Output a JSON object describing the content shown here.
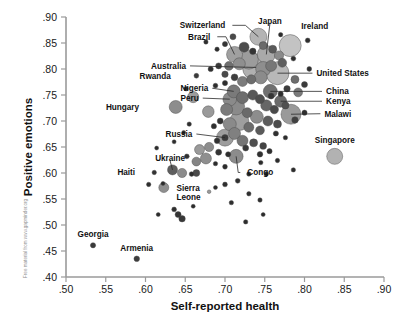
{
  "figure": {
    "credit_text": "Free material from www.gapminder.org",
    "background_color": "#ffffff"
  },
  "chart_data": {
    "type": "scatter",
    "title": "",
    "subtitle": "",
    "xlabel": "Self-reported health",
    "ylabel": "Positive emotions",
    "xlim": [
      0.5,
      0.9
    ],
    "ylim": [
      0.4,
      0.9
    ],
    "xticks": [
      ".50",
      ".55",
      ".60",
      ".65",
      ".70",
      ".75",
      ".80",
      ".85",
      ".90"
    ],
    "xtick_values": [
      0.5,
      0.55,
      0.6,
      0.65,
      0.7,
      0.75,
      0.8,
      0.85,
      0.9
    ],
    "yticks": [
      ".40",
      ".45",
      ".50",
      ".55",
      ".60",
      ".65",
      ".70",
      ".75",
      ".80",
      ".85",
      ".90"
    ],
    "ytick_values": [
      0.4,
      0.45,
      0.5,
      0.55,
      0.6,
      0.65,
      0.7,
      0.75,
      0.8,
      0.85,
      0.9
    ],
    "grid": false,
    "legend_position": "none",
    "marker_encoding": "bubble size encodes population; gray fill shades vary by region",
    "annotations": [
      {
        "label": "Switzerland",
        "x": 0.742,
        "y": 0.862,
        "lx": 0.7055,
        "ly": 0.884,
        "leader": true
      },
      {
        "label": "Japan",
        "x": 0.752,
        "y": 0.828,
        "lx": 0.7565,
        "ly": 0.893,
        "leader": true
      },
      {
        "label": "Ireland",
        "x": 0.782,
        "y": 0.845,
        "lx": 0.791,
        "ly": 0.883,
        "leader": false
      },
      {
        "label": "Brazil",
        "x": 0.712,
        "y": 0.828,
        "lx": 0.6865,
        "ly": 0.862,
        "leader": true
      },
      {
        "label": "Australia",
        "x": 0.739,
        "y": 0.803,
        "lx": 0.656,
        "ly": 0.806,
        "leader": true
      },
      {
        "label": "United States",
        "x": 0.766,
        "y": 0.792,
        "lx": 0.81,
        "ly": 0.792,
        "leader": true
      },
      {
        "label": "China",
        "x": 0.757,
        "y": 0.757,
        "lx": 0.822,
        "ly": 0.757,
        "leader": true
      },
      {
        "label": "Kenya",
        "x": 0.77,
        "y": 0.738,
        "lx": 0.822,
        "ly": 0.738,
        "leader": true
      },
      {
        "label": "Malawi",
        "x": 0.783,
        "y": 0.713,
        "lx": 0.82,
        "ly": 0.714,
        "leader": true
      },
      {
        "label": "Singapore",
        "x": 0.838,
        "y": 0.632,
        "lx": 0.838,
        "ly": 0.664,
        "leader": false
      },
      {
        "label": "Rwanda",
        "x": 0.664,
        "y": 0.787,
        "lx": 0.637,
        "ly": 0.787,
        "leader": false
      },
      {
        "label": "Nigeria",
        "x": 0.711,
        "y": 0.757,
        "lx": 0.684,
        "ly": 0.763,
        "leader": true
      },
      {
        "label": "Peru",
        "x": 0.706,
        "y": 0.742,
        "lx": 0.672,
        "ly": 0.744,
        "leader": true
      },
      {
        "label": "Hungary",
        "x": 0.638,
        "y": 0.727,
        "lx": 0.597,
        "ly": 0.727,
        "leader": false
      },
      {
        "label": "Russia",
        "x": 0.7,
        "y": 0.668,
        "lx": 0.664,
        "ly": 0.675,
        "leader": true
      },
      {
        "label": "Ukraine",
        "x": 0.634,
        "y": 0.606,
        "lx": 0.631,
        "ly": 0.629,
        "leader": true
      },
      {
        "label": "Haiti",
        "x": 0.611,
        "y": 0.601,
        "lx": 0.592,
        "ly": 0.602,
        "leader": false
      },
      {
        "label": "Sierra Leone",
        "x": 0.623,
        "y": 0.572,
        "lx": 0.634,
        "ly": 0.572,
        "leader": false
      },
      {
        "label": "Congo",
        "x": 0.714,
        "y": 0.632,
        "lx": 0.723,
        "ly": 0.601,
        "leader": true
      },
      {
        "label": "Georgia",
        "x": 0.534,
        "y": 0.461,
        "lx": 0.534,
        "ly": 0.482,
        "leader": false
      },
      {
        "label": "Armenia",
        "x": 0.589,
        "y": 0.435,
        "lx": 0.589,
        "ly": 0.456,
        "leader": false
      }
    ],
    "points": [
      {
        "x": 0.742,
        "y": 0.862,
        "r": 8.5,
        "c": "#b4b4b4"
      },
      {
        "x": 0.752,
        "y": 0.828,
        "r": 9.0,
        "c": "#a9a9a9"
      },
      {
        "x": 0.782,
        "y": 0.845,
        "r": 11.0,
        "c": "#c3c3c3"
      },
      {
        "x": 0.712,
        "y": 0.828,
        "r": 8.0,
        "c": "#a0a0a0"
      },
      {
        "x": 0.739,
        "y": 0.803,
        "r": 13.5,
        "c": "#b0b0b0"
      },
      {
        "x": 0.766,
        "y": 0.792,
        "r": 11.5,
        "c": "#b8b8b8"
      },
      {
        "x": 0.757,
        "y": 0.757,
        "r": 7.0,
        "c": "#707070"
      },
      {
        "x": 0.77,
        "y": 0.738,
        "r": 6.0,
        "c": "#6b6b6b"
      },
      {
        "x": 0.783,
        "y": 0.713,
        "r": 10.0,
        "c": "#9a9a9a"
      },
      {
        "x": 0.838,
        "y": 0.632,
        "r": 8.0,
        "c": "#b2b2b2"
      },
      {
        "x": 0.664,
        "y": 0.787,
        "r": 2.4,
        "c": "#3a3a3a"
      },
      {
        "x": 0.711,
        "y": 0.757,
        "r": 6.5,
        "c": "#7a7a7a"
      },
      {
        "x": 0.706,
        "y": 0.742,
        "r": 6.8,
        "c": "#8a8a8a"
      },
      {
        "x": 0.638,
        "y": 0.727,
        "r": 6.5,
        "c": "#8d8d8d"
      },
      {
        "x": 0.7,
        "y": 0.668,
        "r": 8.5,
        "c": "#9d9d9d"
      },
      {
        "x": 0.634,
        "y": 0.606,
        "r": 5.0,
        "c": "#5e5e5e"
      },
      {
        "x": 0.611,
        "y": 0.601,
        "r": 2.2,
        "c": "#333333"
      },
      {
        "x": 0.623,
        "y": 0.572,
        "r": 5.0,
        "c": "#8f8f8f"
      },
      {
        "x": 0.714,
        "y": 0.632,
        "r": 7.0,
        "c": "#8c8c8c"
      },
      {
        "x": 0.534,
        "y": 0.461,
        "r": 2.6,
        "c": "#3a3a3a"
      },
      {
        "x": 0.589,
        "y": 0.435,
        "r": 2.8,
        "c": "#3d3d3d"
      },
      {
        "x": 0.676,
        "y": 0.852,
        "r": 2.2,
        "c": "#2e2e2e"
      },
      {
        "x": 0.804,
        "y": 0.855,
        "r": 2.4,
        "c": "#2e2e2e"
      },
      {
        "x": 0.724,
        "y": 0.842,
        "r": 5.0,
        "c": "#4d4d4d"
      },
      {
        "x": 0.735,
        "y": 0.834,
        "r": 3.2,
        "c": "#343434"
      },
      {
        "x": 0.748,
        "y": 0.845,
        "r": 4.0,
        "c": "#6a6a6a"
      },
      {
        "x": 0.76,
        "y": 0.838,
        "r": 4.0,
        "c": "#5a5a5a"
      },
      {
        "x": 0.768,
        "y": 0.826,
        "r": 4.6,
        "c": "#8a8a8a"
      },
      {
        "x": 0.73,
        "y": 0.818,
        "r": 9.5,
        "c": "#9c9c9c"
      },
      {
        "x": 0.718,
        "y": 0.81,
        "r": 6.0,
        "c": "#8f8f8f"
      },
      {
        "x": 0.705,
        "y": 0.806,
        "r": 4.4,
        "c": "#6f6f6f"
      },
      {
        "x": 0.692,
        "y": 0.806,
        "r": 3.0,
        "c": "#3a3a3a"
      },
      {
        "x": 0.682,
        "y": 0.8,
        "r": 2.6,
        "c": "#2f2f2f"
      },
      {
        "x": 0.7,
        "y": 0.79,
        "r": 3.2,
        "c": "#4a4a4a"
      },
      {
        "x": 0.748,
        "y": 0.8,
        "r": 7.5,
        "c": "#8e8e8e"
      },
      {
        "x": 0.758,
        "y": 0.806,
        "r": 5.5,
        "c": "#777777"
      },
      {
        "x": 0.772,
        "y": 0.812,
        "r": 4.4,
        "c": "#5f5f5f"
      },
      {
        "x": 0.745,
        "y": 0.784,
        "r": 6.5,
        "c": "#8b8b8b"
      },
      {
        "x": 0.733,
        "y": 0.78,
        "r": 4.6,
        "c": "#6d6d6d"
      },
      {
        "x": 0.722,
        "y": 0.776,
        "r": 5.0,
        "c": "#7c7c7c"
      },
      {
        "x": 0.712,
        "y": 0.784,
        "r": 3.4,
        "c": "#3e3e3e"
      },
      {
        "x": 0.7,
        "y": 0.773,
        "r": 2.6,
        "c": "#2e2e2e"
      },
      {
        "x": 0.688,
        "y": 0.768,
        "r": 2.4,
        "c": "#2e2e2e"
      },
      {
        "x": 0.66,
        "y": 0.746,
        "r": 5.6,
        "c": "#9c9c9c"
      },
      {
        "x": 0.651,
        "y": 0.762,
        "r": 2.2,
        "c": "#2f2f2f"
      },
      {
        "x": 0.679,
        "y": 0.718,
        "r": 5.8,
        "c": "#9a9a9a"
      },
      {
        "x": 0.722,
        "y": 0.745,
        "r": 6.0,
        "c": "#6e6e6e"
      },
      {
        "x": 0.735,
        "y": 0.75,
        "r": 5.0,
        "c": "#585858"
      },
      {
        "x": 0.744,
        "y": 0.742,
        "r": 4.6,
        "c": "#4e4e4e"
      },
      {
        "x": 0.752,
        "y": 0.73,
        "r": 5.6,
        "c": "#666666"
      },
      {
        "x": 0.762,
        "y": 0.722,
        "r": 4.2,
        "c": "#4a4a4a"
      },
      {
        "x": 0.776,
        "y": 0.73,
        "r": 3.6,
        "c": "#505050"
      },
      {
        "x": 0.714,
        "y": 0.728,
        "r": 8.5,
        "c": "#8a8a8a"
      },
      {
        "x": 0.702,
        "y": 0.722,
        "r": 6.0,
        "c": "#7b7b7b"
      },
      {
        "x": 0.728,
        "y": 0.716,
        "r": 5.0,
        "c": "#6a6a6a"
      },
      {
        "x": 0.74,
        "y": 0.708,
        "r": 6.5,
        "c": "#8d8d8d"
      },
      {
        "x": 0.754,
        "y": 0.7,
        "r": 5.0,
        "c": "#5d5d5d"
      },
      {
        "x": 0.766,
        "y": 0.694,
        "r": 4.0,
        "c": "#4c4c4c"
      },
      {
        "x": 0.718,
        "y": 0.7,
        "r": 9.5,
        "c": "#9e9e9e"
      },
      {
        "x": 0.706,
        "y": 0.694,
        "r": 6.5,
        "c": "#8a8a8a"
      },
      {
        "x": 0.694,
        "y": 0.7,
        "r": 3.0,
        "c": "#333333"
      },
      {
        "x": 0.686,
        "y": 0.69,
        "r": 2.6,
        "c": "#2e2e2e"
      },
      {
        "x": 0.73,
        "y": 0.688,
        "r": 5.0,
        "c": "#6c6c6c"
      },
      {
        "x": 0.744,
        "y": 0.682,
        "r": 4.4,
        "c": "#5a5a5a"
      },
      {
        "x": 0.712,
        "y": 0.676,
        "r": 6.0,
        "c": "#808080"
      },
      {
        "x": 0.7,
        "y": 0.668,
        "r": 3.2,
        "c": "#3a3a3a"
      },
      {
        "x": 0.69,
        "y": 0.662,
        "r": 2.8,
        "c": "#303030"
      },
      {
        "x": 0.722,
        "y": 0.662,
        "r": 5.5,
        "c": "#757575"
      },
      {
        "x": 0.736,
        "y": 0.658,
        "r": 4.0,
        "c": "#4f4f4f"
      },
      {
        "x": 0.748,
        "y": 0.652,
        "r": 3.4,
        "c": "#444444"
      },
      {
        "x": 0.68,
        "y": 0.65,
        "r": 4.6,
        "c": "#8d8d8d"
      },
      {
        "x": 0.668,
        "y": 0.645,
        "r": 5.0,
        "c": "#9a9a9a"
      },
      {
        "x": 0.692,
        "y": 0.64,
        "r": 3.0,
        "c": "#343434"
      },
      {
        "x": 0.704,
        "y": 0.636,
        "r": 2.6,
        "c": "#2e2e2e"
      },
      {
        "x": 0.676,
        "y": 0.628,
        "r": 5.5,
        "c": "#8f8f8f"
      },
      {
        "x": 0.664,
        "y": 0.622,
        "r": 4.4,
        "c": "#858585"
      },
      {
        "x": 0.652,
        "y": 0.632,
        "r": 2.4,
        "c": "#2f2f2f"
      },
      {
        "x": 0.688,
        "y": 0.618,
        "r": 2.2,
        "c": "#2c2c2c"
      },
      {
        "x": 0.7,
        "y": 0.612,
        "r": 2.4,
        "c": "#2c2c2c"
      },
      {
        "x": 0.726,
        "y": 0.648,
        "r": 3.0,
        "c": "#383838"
      },
      {
        "x": 0.744,
        "y": 0.636,
        "r": 2.8,
        "c": "#303030"
      },
      {
        "x": 0.756,
        "y": 0.642,
        "r": 2.6,
        "c": "#2e2e2e"
      },
      {
        "x": 0.646,
        "y": 0.6,
        "r": 4.6,
        "c": "#8c8c8c"
      },
      {
        "x": 0.658,
        "y": 0.598,
        "r": 2.4,
        "c": "#2d2d2d"
      },
      {
        "x": 0.664,
        "y": 0.6,
        "r": 3.4,
        "c": "#4a4a4a"
      },
      {
        "x": 0.68,
        "y": 0.564,
        "r": 1.8,
        "c": "#9a9a9a"
      },
      {
        "x": 0.641,
        "y": 0.52,
        "r": 3.0,
        "c": "#343434"
      },
      {
        "x": 0.646,
        "y": 0.512,
        "r": 3.2,
        "c": "#383838"
      },
      {
        "x": 0.636,
        "y": 0.53,
        "r": 2.4,
        "c": "#2e2e2e"
      },
      {
        "x": 0.66,
        "y": 0.536,
        "r": 2.0,
        "c": "#2c2c2c"
      },
      {
        "x": 0.622,
        "y": 0.58,
        "r": 2.0,
        "c": "#2c2c2c"
      },
      {
        "x": 0.604,
        "y": 0.578,
        "r": 2.2,
        "c": "#2e2e2e"
      },
      {
        "x": 0.716,
        "y": 0.585,
        "r": 2.4,
        "c": "#303030"
      },
      {
        "x": 0.73,
        "y": 0.598,
        "r": 2.2,
        "c": "#2c2c2c"
      },
      {
        "x": 0.752,
        "y": 0.598,
        "r": 2.2,
        "c": "#2c2c2c"
      },
      {
        "x": 0.7,
        "y": 0.578,
        "r": 2.4,
        "c": "#2e2e2e"
      },
      {
        "x": 0.688,
        "y": 0.572,
        "r": 2.0,
        "c": "#2c2c2c"
      },
      {
        "x": 0.73,
        "y": 0.56,
        "r": 2.2,
        "c": "#2e2e2e"
      },
      {
        "x": 0.744,
        "y": 0.548,
        "r": 2.2,
        "c": "#2e2e2e"
      },
      {
        "x": 0.708,
        "y": 0.543,
        "r": 2.2,
        "c": "#2e2e2e"
      },
      {
        "x": 0.614,
        "y": 0.648,
        "r": 2.0,
        "c": "#2c2c2c"
      },
      {
        "x": 0.8,
        "y": 0.77,
        "r": 3.0,
        "c": "#3a3a3a"
      },
      {
        "x": 0.806,
        "y": 0.8,
        "r": 2.4,
        "c": "#2e2e2e"
      },
      {
        "x": 0.788,
        "y": 0.78,
        "r": 4.0,
        "c": "#6e6e6e"
      },
      {
        "x": 0.792,
        "y": 0.755,
        "r": 4.4,
        "c": "#7a7a7a"
      },
      {
        "x": 0.778,
        "y": 0.762,
        "r": 3.2,
        "c": "#3c3c3c"
      },
      {
        "x": 0.77,
        "y": 0.752,
        "r": 2.6,
        "c": "#2e2e2e"
      },
      {
        "x": 0.758,
        "y": 0.748,
        "r": 3.0,
        "c": "#353535"
      },
      {
        "x": 0.788,
        "y": 0.702,
        "r": 3.2,
        "c": "#404040"
      },
      {
        "x": 0.8,
        "y": 0.716,
        "r": 2.6,
        "c": "#2e2e2e"
      },
      {
        "x": 0.764,
        "y": 0.676,
        "r": 2.6,
        "c": "#303030"
      },
      {
        "x": 0.776,
        "y": 0.668,
        "r": 2.2,
        "c": "#2c2c2c"
      },
      {
        "x": 0.745,
        "y": 0.62,
        "r": 2.2,
        "c": "#2c2c2c"
      },
      {
        "x": 0.766,
        "y": 0.624,
        "r": 2.2,
        "c": "#2c2c2c"
      },
      {
        "x": 0.786,
        "y": 0.606,
        "r": 2.2,
        "c": "#2c2c2c"
      },
      {
        "x": 0.726,
        "y": 0.506,
        "r": 2.2,
        "c": "#2c2c2c"
      },
      {
        "x": 0.748,
        "y": 0.52,
        "r": 2.0,
        "c": "#2c2c2c"
      },
      {
        "x": 0.616,
        "y": 0.52,
        "r": 2.0,
        "c": "#2c2c2c"
      },
      {
        "x": 0.655,
        "y": 0.694,
        "r": 2.2,
        "c": "#2e2e2e"
      },
      {
        "x": 0.648,
        "y": 0.678,
        "r": 2.0,
        "c": "#2c2c2c"
      },
      {
        "x": 0.636,
        "y": 0.66,
        "r": 2.0,
        "c": "#2c2c2c"
      },
      {
        "x": 0.71,
        "y": 0.862,
        "r": 3.0,
        "c": "#4a4a4a"
      },
      {
        "x": 0.7,
        "y": 0.848,
        "r": 2.6,
        "c": "#343434"
      },
      {
        "x": 0.69,
        "y": 0.838,
        "r": 2.2,
        "c": "#2c2c2c"
      },
      {
        "x": 0.786,
        "y": 0.82,
        "r": 2.4,
        "c": "#2e2e2e"
      },
      {
        "x": 0.77,
        "y": 0.866,
        "r": 2.2,
        "c": "#2c2c2c"
      }
    ]
  }
}
